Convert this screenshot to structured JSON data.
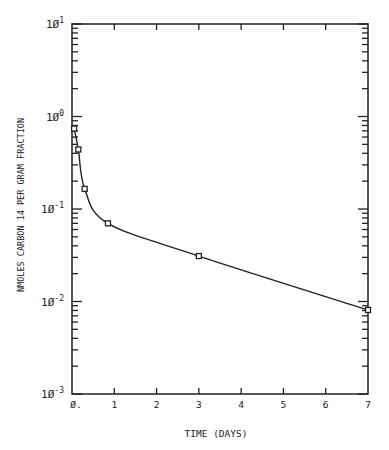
{
  "chart_data": {
    "type": "line",
    "title": "",
    "xlabel": "TIME (DAYS)",
    "ylabel": "NMOLES CARBON 14 PER GRAM FRACTION",
    "yscale": "log",
    "xlim": [
      0,
      7
    ],
    "ylim": [
      0.001,
      10
    ],
    "x_tick_labels": [
      "0.",
      "1",
      "2",
      "3",
      "4",
      "5",
      "6",
      "7"
    ],
    "y_tick_labels": [
      {
        "base": "10",
        "exp": "1"
      },
      {
        "base": "10",
        "exp": "0"
      },
      {
        "base": "10",
        "exp": "-1"
      },
      {
        "base": "10",
        "exp": "-2"
      },
      {
        "base": "10",
        "exp": "-3"
      }
    ],
    "grid": false,
    "legend": null,
    "series": [
      {
        "name": "Carbon 14",
        "marker": "square",
        "x": [
          0.05,
          0.15,
          0.3,
          0.85,
          3.0,
          7.0
        ],
        "y": [
          0.74,
          0.44,
          0.165,
          0.07,
          0.031,
          0.0081
        ]
      }
    ]
  }
}
